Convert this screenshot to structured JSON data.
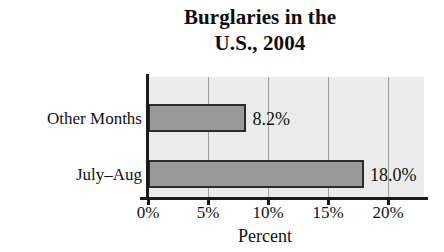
{
  "chart_data": {
    "type": "bar",
    "orientation": "horizontal",
    "title": "Burglaries in the U.S., 2004",
    "title_lines": [
      "Burglaries in the",
      "U.S., 2004"
    ],
    "categories": [
      "Other Months",
      "July–Aug"
    ],
    "values": [
      8.2,
      18.0
    ],
    "value_labels": [
      "8.2%",
      "18.0%"
    ],
    "xlabel": "Percent",
    "ylabel": "",
    "xlim": [
      0,
      22.8
    ],
    "xticks": [
      0,
      5,
      10,
      15,
      20
    ],
    "xtick_labels": [
      "0%",
      "5%",
      "10%",
      "15%",
      "20%"
    ],
    "grid": true,
    "grid_axis": "x",
    "legend": null,
    "colors": {
      "bar_fill": "#9a9a9a",
      "bar_edge": "#2b2b2b",
      "plot_background": "#ebebeb",
      "figure_background": "#ffffff",
      "gridline": "#9d9d9d",
      "axis": "#1a1a1a",
      "text": "#111111"
    }
  }
}
